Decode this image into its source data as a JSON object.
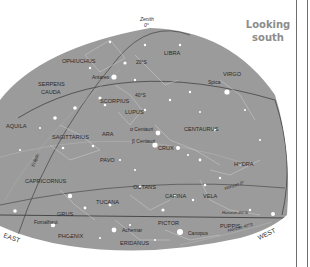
{
  "title": {
    "line1": "Looking",
    "line2": "south"
  },
  "colors": {
    "sky": "#9b9b9b",
    "star": "#ffffff",
    "label": "#2a2a2a",
    "line": "#c8c8c8",
    "horizon": "#4a4a4a",
    "bg": "#ffffff"
  },
  "zenith": {
    "label": "Zenith",
    "value": "0°"
  },
  "directions": {
    "east": "EAST",
    "west": "WEST"
  },
  "altitude_labels": {
    "a20": "20°S",
    "a40": "40°S"
  },
  "horizons": {
    "h0": "Horizon 0°",
    "h20": "Horizon 20°S",
    "h40": "Horizon 40°S"
  },
  "ecliptic": "Ecliptic",
  "constellations": {
    "ophiuchus": "OPHIUCHUS",
    "libra": "LIBRA",
    "virgo": "VIRGO",
    "serpens1": "SERPENS",
    "serpens2": "CAUDA",
    "scorpius": "SCORPIUS",
    "lupus": "LUPUS",
    "aquila": "AQUILA",
    "sagittarius": "SAGITTARIUS",
    "ara": "ARA",
    "centaurus": "CENTAURUS",
    "crux": "CRUX",
    "pavo": "PAVO",
    "hydra": "HYDRA",
    "capricornus": "CAPRICORNUS",
    "octans": "OCTANS",
    "carina": "CARINA",
    "vela": "VELA",
    "tucana": "TUCANA",
    "grus": "GRUS",
    "pictor": "PICTOR",
    "puppis": "PUPPIS",
    "phoenix": "PHOENIX",
    "eridanus": "ERIDANUS"
  },
  "stars": {
    "antares": "Antares",
    "spica": "Spica",
    "alpha_cen": "α Centauri",
    "beta_cen": "β Centauri",
    "fomalhaut": "Fomalhaut",
    "achernar": "Achernar",
    "canopus": "Canopus"
  }
}
